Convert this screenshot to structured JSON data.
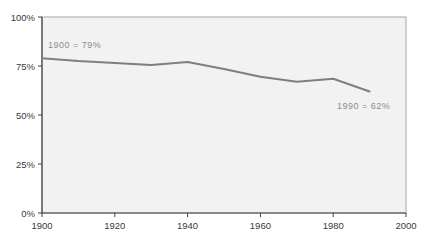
{
  "chart": {
    "background": "#ffffff",
    "plot_background": "#f2f2f2",
    "plot_border_color": "#a8a8a8",
    "axis_color": "#404040",
    "tick_label_color": "#3a3a3a",
    "annotation_color": "#8c8c8c"
  },
  "chart_data": {
    "type": "line",
    "title": "",
    "xlabel": "",
    "ylabel": "",
    "x": [
      1900,
      1910,
      1920,
      1930,
      1940,
      1950,
      1960,
      1970,
      1980,
      1990
    ],
    "values": [
      79,
      77.5,
      76.5,
      75.5,
      77,
      73.5,
      69.5,
      67,
      68.5,
      62
    ],
    "line_color": "#7f7f7f",
    "line_width": 2,
    "markers": false,
    "grid": false,
    "legend": "none",
    "xlim": [
      1900,
      2000
    ],
    "ylim": [
      0,
      100
    ],
    "x_tick_values": [
      1900,
      1920,
      1940,
      1960,
      1980,
      2000
    ],
    "x_tick_labels": [
      "1900",
      "1920",
      "1940",
      "1960",
      "1980",
      "2000"
    ],
    "y_tick_values": [
      0,
      25,
      50,
      75,
      100
    ],
    "y_tick_labels": [
      "0%",
      "25%",
      "50%",
      "75%",
      "100%"
    ],
    "annotations": [
      {
        "text": "1900 = 79%",
        "x": 48,
        "y": 45
      },
      {
        "text": "1990 = 62%",
        "x": 337,
        "y": 106
      }
    ]
  }
}
